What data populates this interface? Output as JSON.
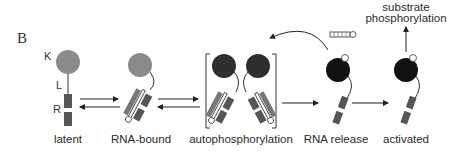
{
  "panel_label": "B",
  "domain_labels": {
    "kinase": "K",
    "linker": "L",
    "rna_binding": "R"
  },
  "stages": [
    {
      "id": "latent",
      "label": "latent"
    },
    {
      "id": "rna-bound",
      "label": "RNA-bound"
    },
    {
      "id": "autophosphorylation",
      "label": "autophosphorylation"
    },
    {
      "id": "rna-release",
      "label": "RNA release"
    },
    {
      "id": "activated",
      "label": "activated"
    }
  ],
  "output_label_line1": "substrate",
  "output_label_line2": "phosphorylation",
  "phospho_mark": "P",
  "colors": {
    "latent_kinase": "#8a8a8a",
    "active_kinase": "#111111",
    "dimer_kinase": "#2e2e2e",
    "domain": "#555555",
    "line": "#333333"
  }
}
